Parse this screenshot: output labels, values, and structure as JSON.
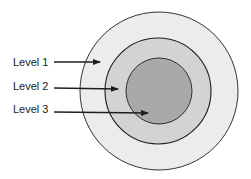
{
  "diagram": {
    "type": "concentric-circles",
    "colors": {
      "outer_fill": "#ececec",
      "middle_fill": "#d3d3d3",
      "inner_fill": "#a9a9a9",
      "stroke": "#1e1e1e"
    },
    "levels": [
      {
        "label": "Level 1"
      },
      {
        "label": "Level 2"
      },
      {
        "label": "Level 3"
      }
    ]
  }
}
